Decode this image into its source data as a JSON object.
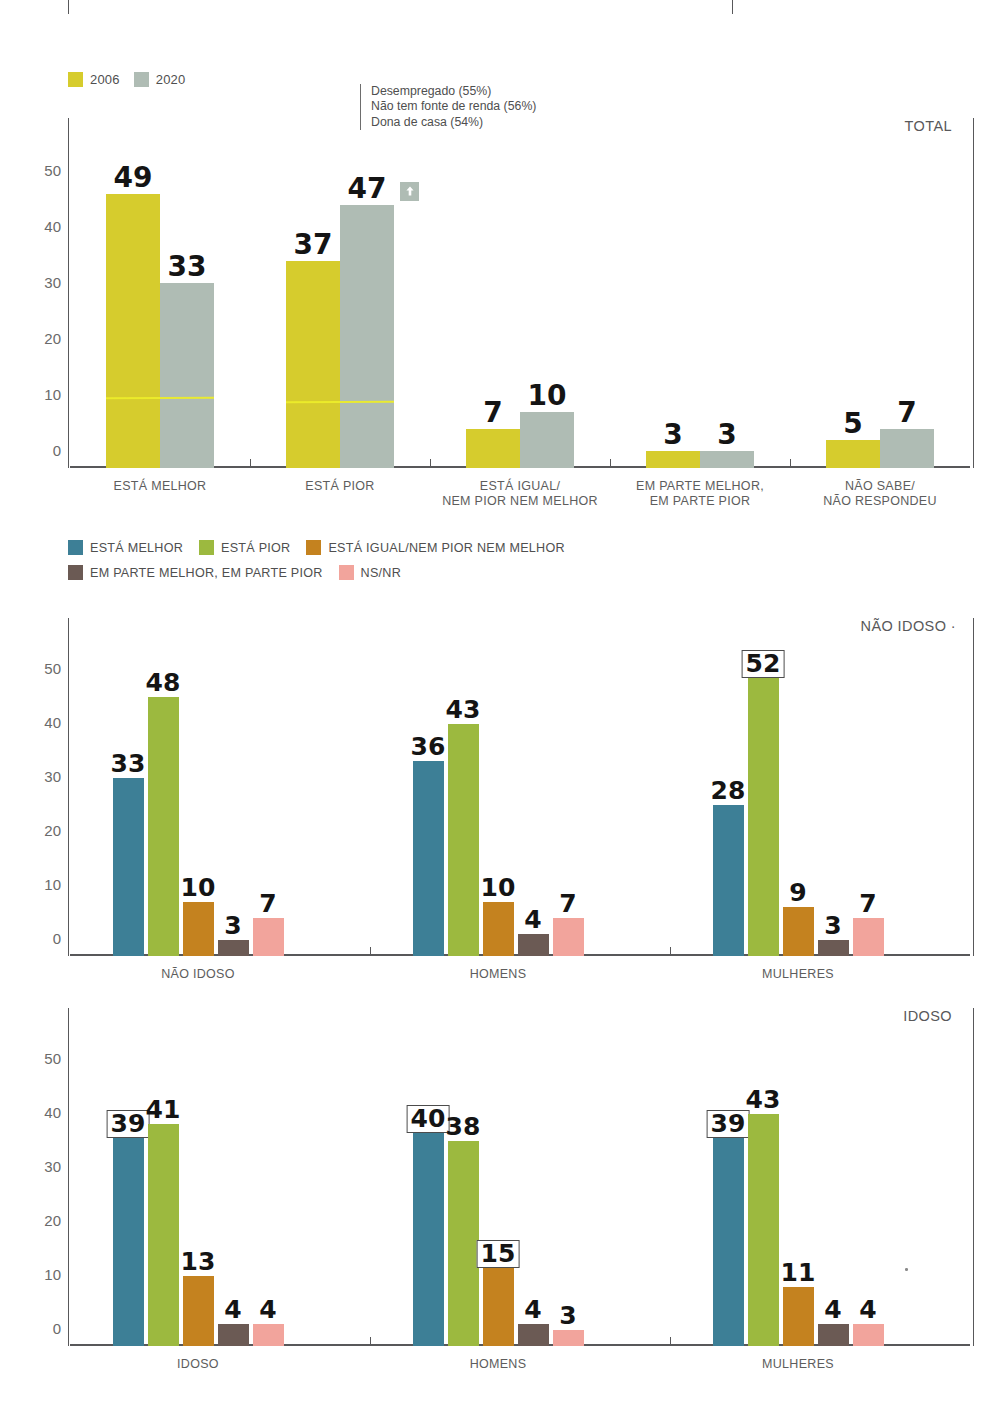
{
  "colors": {
    "yellow_2006": "#D6CC2D",
    "gray_2020": "#AFBCB4",
    "blue_melhor": "#3D7F96",
    "green_pior": "#9CB93F",
    "orange_igual": "#C4821F",
    "brown_parte": "#6B5A54",
    "pink_nsnr": "#F2A49C",
    "axis": "#58585a",
    "yellow_rule": "#ECEC2A"
  },
  "legend_top": {
    "items": [
      {
        "label": "2006",
        "color": "#D6CC2D"
      },
      {
        "label": "2020",
        "color": "#AFBCB4"
      }
    ]
  },
  "annotation": {
    "lines": [
      "Desempregado (55%)",
      "Não tem fonte de renda (56%)",
      "Dona de casa (54%)"
    ]
  },
  "legend_bottom": {
    "row1": [
      {
        "label": "ESTÁ MELHOR",
        "color": "#3D7F96"
      },
      {
        "label": "ESTÁ PIOR",
        "color": "#9CB93F"
      },
      {
        "label": "ESTÁ IGUAL/NEM PIOR NEM MELHOR",
        "color": "#C4821F"
      }
    ],
    "row2": [
      {
        "label": "EM PARTE MELHOR, EM PARTE PIOR",
        "color": "#6B5A54"
      },
      {
        "label": "NS/NR",
        "color": "#F2A49C"
      }
    ]
  },
  "chart_data": [
    {
      "id": "total",
      "type": "bar",
      "title": "TOTAL",
      "corner_label": "TOTAL",
      "xlabel": "",
      "ylabel": "",
      "ylim": [
        0,
        55
      ],
      "yticks": [
        0,
        10,
        20,
        30,
        40,
        50
      ],
      "grid": false,
      "legend_position": "top-left",
      "categories": [
        "ESTÁ MELHOR",
        "ESTÁ PIOR",
        "ESTÁ IGUAL/\nNEM PIOR NEM MELHOR",
        "EM PARTE MELHOR,\nEM PARTE PIOR",
        "NÃO SABE/\nNÃO RESPONDEU"
      ],
      "category_lines": [
        [
          "ESTÁ MELHOR"
        ],
        [
          "ESTÁ PIOR"
        ],
        [
          "ESTÁ IGUAL/",
          "NEM PIOR NEM MELHOR"
        ],
        [
          "EM PARTE MELHOR,",
          "EM PARTE PIOR"
        ],
        [
          "NÃO SABE/",
          "NÃO RESPONDEU"
        ]
      ],
      "series": [
        {
          "name": "2006",
          "color": "#D6CC2D",
          "values": [
            49,
            37,
            7,
            3,
            5
          ]
        },
        {
          "name": "2020",
          "color": "#AFBCB4",
          "values": [
            33,
            47,
            10,
            3,
            7
          ]
        }
      ],
      "badges": [
        {
          "category": "ESTÁ PIOR",
          "series": "2020",
          "icon": "arrow-up-icon"
        }
      ]
    },
    {
      "id": "nao-idoso",
      "type": "bar",
      "title": "NÃO IDOSO",
      "corner_label": "NÃO IDOSO ·",
      "xlabel": "",
      "ylabel": "",
      "ylim": [
        0,
        57
      ],
      "yticks": [
        0,
        10,
        20,
        30,
        40,
        50
      ],
      "grid": false,
      "legend_position": "above",
      "categories": [
        "NÃO IDOSO",
        "HOMENS",
        "MULHERES"
      ],
      "series": [
        {
          "name": "ESTÁ MELHOR",
          "color": "#3D7F96",
          "values": [
            33,
            36,
            28
          ]
        },
        {
          "name": "ESTÁ PIOR",
          "color": "#9CB93F",
          "values": [
            48,
            43,
            52
          ]
        },
        {
          "name": "ESTÁ IGUAL/NEM PIOR NEM MELHOR",
          "color": "#C4821F",
          "values": [
            10,
            10,
            9
          ]
        },
        {
          "name": "EM PARTE MELHOR, EM PARTE PIOR",
          "color": "#6B5A54",
          "values": [
            3,
            4,
            3
          ]
        },
        {
          "name": "NS/NR",
          "color": "#F2A49C",
          "values": [
            7,
            7,
            7
          ]
        }
      ],
      "highlighted": [
        {
          "category": "MULHERES",
          "series": "ESTÁ PIOR",
          "value": 52
        }
      ]
    },
    {
      "id": "idoso",
      "type": "bar",
      "title": "IDOSO",
      "corner_label": "IDOSO",
      "xlabel": "",
      "ylabel": "",
      "ylim": [
        0,
        57
      ],
      "yticks": [
        0,
        10,
        20,
        30,
        40,
        50
      ],
      "grid": false,
      "legend_position": "shared",
      "categories": [
        "IDOSO",
        "HOMENS",
        "MULHERES"
      ],
      "series": [
        {
          "name": "ESTÁ MELHOR",
          "color": "#3D7F96",
          "values": [
            39,
            40,
            39
          ]
        },
        {
          "name": "ESTÁ PIOR",
          "color": "#9CB93F",
          "values": [
            41,
            38,
            43
          ]
        },
        {
          "name": "ESTÁ IGUAL/NEM PIOR NEM MELHOR",
          "color": "#C4821F",
          "values": [
            13,
            15,
            11
          ]
        },
        {
          "name": "EM PARTE MELHOR, EM PARTE PIOR",
          "color": "#6B5A54",
          "values": [
            4,
            4,
            4
          ]
        },
        {
          "name": "NS/NR",
          "color": "#F2A49C",
          "values": [
            4,
            3,
            4
          ]
        }
      ],
      "highlighted": [
        {
          "category": "IDOSO",
          "series": "ESTÁ MELHOR",
          "value": 39
        },
        {
          "category": "HOMENS",
          "series": "ESTÁ MELHOR",
          "value": 40
        },
        {
          "category": "HOMENS",
          "series": "ESTÁ IGUAL/NEM PIOR NEM MELHOR",
          "value": 15
        },
        {
          "category": "MULHERES",
          "series": "ESTÁ MELHOR",
          "value": 39
        }
      ]
    }
  ]
}
